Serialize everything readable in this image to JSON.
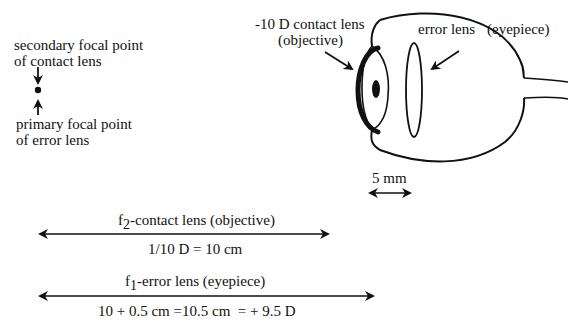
{
  "focal_labels": {
    "secondary_line1": "secondary focal point",
    "secondary_line2": "of contact lens",
    "primary_line1": "primary focal point",
    "primary_line2": "of error lens"
  },
  "eye_labels": {
    "contact_lens_line1": "-10 D contact lens",
    "contact_lens_line2": "(objective)",
    "error_lens": "error lens",
    "eyepiece": "(eyepiece)",
    "scale": "5 mm"
  },
  "dimensions": {
    "f2": {
      "prefix": "f",
      "subscript": "2",
      "label": "-contact lens (objective)",
      "value": "1/10 D = 10 cm"
    },
    "f1": {
      "prefix": "f",
      "subscript": "1",
      "label": "-error lens (eyepiece)",
      "value": "10 + 0.5 cm =10.5 cm  = + 9.5 D"
    }
  }
}
